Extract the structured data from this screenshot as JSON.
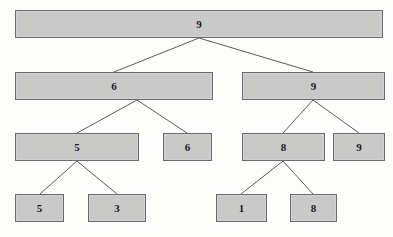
{
  "figure": {
    "type": "binary-tree-diagram",
    "caption": "",
    "colors": {
      "node_fill": "#c9c9c8",
      "node_border": "#6a6a68",
      "edge": "#5a5a58",
      "text": "#1a1a1a",
      "page_background": "#fdfdfc"
    }
  },
  "nodes": [
    {
      "id": "n0",
      "label": "9",
      "level": 0,
      "x": 15,
      "y": 10,
      "w": 368,
      "h": 28
    },
    {
      "id": "n1",
      "label": "6",
      "level": 1,
      "x": 15,
      "y": 72,
      "w": 198,
      "h": 28
    },
    {
      "id": "n2",
      "label": "9",
      "level": 1,
      "x": 242,
      "y": 72,
      "w": 143,
      "h": 28
    },
    {
      "id": "n3",
      "label": "5",
      "level": 2,
      "x": 15,
      "y": 133,
      "w": 124,
      "h": 28
    },
    {
      "id": "n4",
      "label": "6",
      "level": 2,
      "x": 163,
      "y": 133,
      "w": 49,
      "h": 28
    },
    {
      "id": "n5",
      "label": "8",
      "level": 2,
      "x": 242,
      "y": 133,
      "w": 83,
      "h": 28
    },
    {
      "id": "n6",
      "label": "9",
      "level": 2,
      "x": 333,
      "y": 133,
      "w": 52,
      "h": 28
    },
    {
      "id": "n7",
      "label": "5",
      "level": 3,
      "x": 15,
      "y": 194,
      "w": 49,
      "h": 28
    },
    {
      "id": "n8",
      "label": "3",
      "level": 3,
      "x": 88,
      "y": 194,
      "w": 58,
      "h": 28
    },
    {
      "id": "n9",
      "label": "1",
      "level": 3,
      "x": 216,
      "y": 194,
      "w": 51,
      "h": 28
    },
    {
      "id": "n10",
      "label": "8",
      "level": 3,
      "x": 290,
      "y": 194,
      "w": 47,
      "h": 28
    }
  ],
  "edges": [
    {
      "from": "n0",
      "to": "n1",
      "x1": 199,
      "y1": 38,
      "x2": 114,
      "y2": 72
    },
    {
      "from": "n0",
      "to": "n2",
      "x1": 199,
      "y1": 38,
      "x2": 313,
      "y2": 72
    },
    {
      "from": "n1",
      "to": "n3",
      "x1": 137,
      "y1": 100,
      "x2": 77,
      "y2": 133
    },
    {
      "from": "n1",
      "to": "n4",
      "x1": 137,
      "y1": 100,
      "x2": 187,
      "y2": 133
    },
    {
      "from": "n2",
      "to": "n5",
      "x1": 313,
      "y1": 100,
      "x2": 283,
      "y2": 133
    },
    {
      "from": "n2",
      "to": "n6",
      "x1": 313,
      "y1": 100,
      "x2": 359,
      "y2": 133
    },
    {
      "from": "n3",
      "to": "n7",
      "x1": 77,
      "y1": 161,
      "x2": 40,
      "y2": 194
    },
    {
      "from": "n3",
      "to": "n8",
      "x1": 77,
      "y1": 161,
      "x2": 117,
      "y2": 194
    },
    {
      "from": "n5",
      "to": "n9",
      "x1": 283,
      "y1": 161,
      "x2": 241,
      "y2": 194
    },
    {
      "from": "n5",
      "to": "n10",
      "x1": 283,
      "y1": 161,
      "x2": 313,
      "y2": 194
    }
  ],
  "caption": {
    "text": "",
    "x": 0,
    "y": 229
  }
}
